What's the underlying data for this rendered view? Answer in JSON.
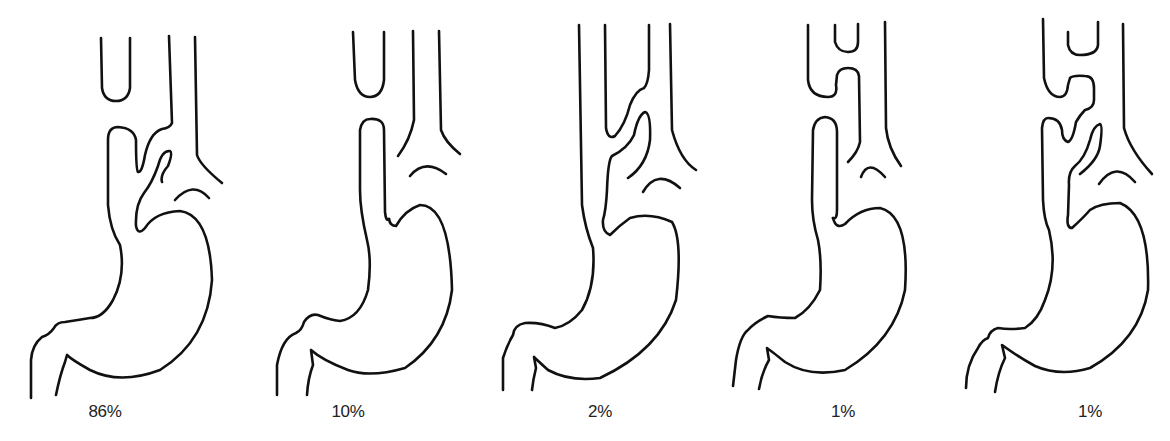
{
  "figure": {
    "panels": [
      {
        "id": "type-1",
        "percentage": "86%",
        "label_x": 105
      },
      {
        "id": "type-2",
        "percentage": "10%",
        "label_x": 348
      },
      {
        "id": "type-3",
        "percentage": "2%",
        "label_x": 600
      },
      {
        "id": "type-4",
        "percentage": "1%",
        "label_x": 843
      },
      {
        "id": "type-5",
        "percentage": "1%",
        "label_x": 1090
      }
    ],
    "colors": {
      "line": "#111111",
      "background": "#ffffff",
      "text": "#222222"
    }
  }
}
